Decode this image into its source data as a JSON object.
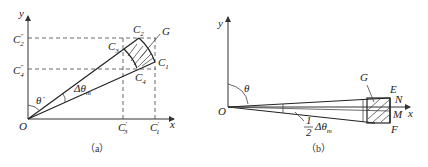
{
  "panel_a": {
    "caption": "（a）",
    "labels": {
      "y_axis": "y",
      "x_axis": "x",
      "origin": "O",
      "theta": "θ̇",
      "delta_theta": "Δθ",
      "delta_theta_sub": "m",
      "C1": "C",
      "C1_sub": "1",
      "C2": "C",
      "C2_sub": "2",
      "C3": "C",
      "C3_sub": "3",
      "C4": "C",
      "C4_sub": "4",
      "G": "G",
      "C2pp": "C",
      "C2pp_sub": "2",
      "C2pp_sup": "″",
      "C4pp": "C",
      "C4pp_sub": "4",
      "C4pp_sup": "″",
      "C3p": "C",
      "C3p_sub": "3",
      "C3p_sup": "′",
      "C1p": "C",
      "C1p_sub": "1",
      "C1p_sup": "′"
    }
  },
  "panel_b": {
    "caption": "（b）",
    "labels": {
      "y_axis": "y",
      "x_axis": "x",
      "origin": "O",
      "theta": "θ",
      "G": "G",
      "E": "E",
      "N": "N",
      "M": "M",
      "F": "F",
      "half_num": "1",
      "half_den": "2",
      "delta_theta": "Δθ",
      "delta_theta_sub": "m"
    }
  }
}
